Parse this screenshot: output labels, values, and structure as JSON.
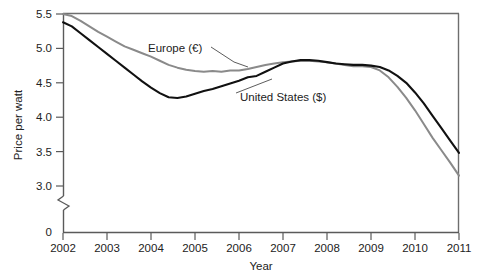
{
  "chart_data": {
    "type": "line",
    "title": "",
    "xlabel": "Year",
    "ylabel": "Price per watt",
    "xlim": [
      2002,
      2011
    ],
    "ylim": [
      3.0,
      5.5
    ],
    "y_axis_break": true,
    "y_break_label": "0",
    "grid": false,
    "legend_position": "inline-annotations",
    "x_ticklabels": [
      "2002",
      "2003",
      "2004",
      "2005",
      "2006",
      "2007",
      "2008",
      "2009",
      "2010",
      "2011"
    ],
    "x_ticks": [
      2002,
      2003,
      2004,
      2005,
      2006,
      2007,
      2008,
      2009,
      2010,
      2011
    ],
    "y_ticklabels": [
      "0",
      "3.0",
      "3.5",
      "4.0",
      "4.5",
      "5.0",
      "5.5"
    ],
    "y_ticks": [
      3.0,
      3.5,
      4.0,
      4.5,
      5.0,
      5.5
    ],
    "series": [
      {
        "name": "Europe (€)",
        "color": "#8a8a8a",
        "label_text": "Europe (€)",
        "x": [
          2002.0,
          2002.2,
          2002.4,
          2002.6,
          2002.8,
          2003.0,
          2003.2,
          2003.4,
          2003.6,
          2003.8,
          2004.0,
          2004.2,
          2004.4,
          2004.6,
          2004.8,
          2005.0,
          2005.2,
          2005.4,
          2005.6,
          2005.8,
          2006.0,
          2006.2,
          2006.4,
          2006.6,
          2006.8,
          2007.0,
          2007.2,
          2007.4,
          2007.6,
          2007.8,
          2008.0,
          2008.2,
          2008.4,
          2008.6,
          2008.8,
          2009.0,
          2009.2,
          2009.4,
          2009.6,
          2009.8,
          2010.0,
          2010.2,
          2010.4,
          2010.6,
          2010.8,
          2011.0
        ],
        "y": [
          5.5,
          5.47,
          5.4,
          5.32,
          5.24,
          5.17,
          5.1,
          5.03,
          4.98,
          4.93,
          4.88,
          4.82,
          4.76,
          4.72,
          4.69,
          4.67,
          4.66,
          4.67,
          4.66,
          4.68,
          4.68,
          4.7,
          4.73,
          4.76,
          4.78,
          4.8,
          4.81,
          4.82,
          4.82,
          4.81,
          4.8,
          4.78,
          4.76,
          4.74,
          4.74,
          4.73,
          4.68,
          4.58,
          4.44,
          4.28,
          4.1,
          3.9,
          3.7,
          3.52,
          3.34,
          3.15
        ]
      },
      {
        "name": "United States ($)",
        "color": "#111111",
        "label_text": "United States ($)",
        "x": [
          2002.0,
          2002.2,
          2002.4,
          2002.6,
          2002.8,
          2003.0,
          2003.2,
          2003.4,
          2003.6,
          2003.8,
          2004.0,
          2004.2,
          2004.4,
          2004.6,
          2004.8,
          2005.0,
          2005.2,
          2005.4,
          2005.6,
          2005.8,
          2006.0,
          2006.2,
          2006.4,
          2006.6,
          2006.8,
          2007.0,
          2007.2,
          2007.4,
          2007.6,
          2007.8,
          2008.0,
          2008.2,
          2008.4,
          2008.6,
          2008.8,
          2009.0,
          2009.2,
          2009.4,
          2009.6,
          2009.8,
          2010.0,
          2010.2,
          2010.4,
          2010.6,
          2010.8,
          2011.0
        ],
        "y": [
          5.38,
          5.32,
          5.22,
          5.12,
          5.02,
          4.92,
          4.82,
          4.72,
          4.62,
          4.52,
          4.43,
          4.35,
          4.29,
          4.28,
          4.3,
          4.34,
          4.38,
          4.41,
          4.45,
          4.49,
          4.53,
          4.58,
          4.6,
          4.66,
          4.72,
          4.78,
          4.81,
          4.83,
          4.83,
          4.82,
          4.8,
          4.78,
          4.77,
          4.76,
          4.76,
          4.75,
          4.73,
          4.68,
          4.6,
          4.5,
          4.36,
          4.2,
          4.02,
          3.84,
          3.66,
          3.48
        ]
      }
    ],
    "annotations": [
      {
        "text": "Europe (€)",
        "x": 2004.9,
        "y": 5.06
      },
      {
        "text": "United States ($)",
        "x": 2006.9,
        "y": 4.12
      }
    ]
  }
}
